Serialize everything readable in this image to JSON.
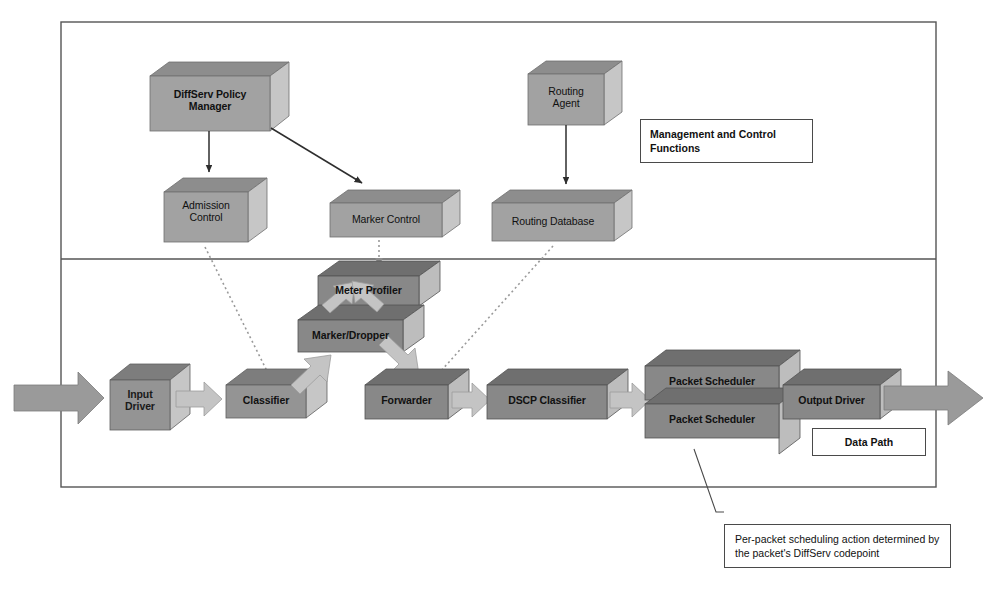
{
  "diagram": {
    "frame": {
      "outer_border_color": "#555555",
      "divider_label": "section-divider"
    },
    "palette": {
      "box_front_light": "#9e9e9e",
      "box_front_dark": "#7a7a7a",
      "box_top": "#8a8a8a",
      "box_side": "#c9c9c9",
      "arrow_flow": "#bdbdbd",
      "arrow_big": "#9a9a9a",
      "line": "#3a3a3a",
      "text": "#111111"
    },
    "sections": [
      {
        "id": "management",
        "label": "Management and\nControl Functions"
      },
      {
        "id": "datapath",
        "label": "Data Path"
      }
    ],
    "control_nodes": [
      {
        "id": "diffserv-policy-manager",
        "label": "DiffServ Policy\nManager"
      },
      {
        "id": "admission-control",
        "label": "Admission\nControl"
      },
      {
        "id": "marker-control",
        "label": "Marker Control"
      },
      {
        "id": "routing-agent",
        "label": "Routing\nAgent"
      },
      {
        "id": "routing-database",
        "label": "Routing Database"
      }
    ],
    "datapath_nodes": [
      {
        "id": "input-driver",
        "label": "Input\nDriver"
      },
      {
        "id": "classifier",
        "label": "Classifier"
      },
      {
        "id": "meter-profiler",
        "label": "Meter Profiler"
      },
      {
        "id": "marker-dropper",
        "label": "Marker/Dropper"
      },
      {
        "id": "forwarder",
        "label": "Forwarder"
      },
      {
        "id": "dscp-classifier",
        "label": "DSCP Classifier"
      },
      {
        "id": "packet-scheduler-1",
        "label": "Packet Scheduler"
      },
      {
        "id": "packet-scheduler-2",
        "label": "Packet Scheduler"
      },
      {
        "id": "output-driver",
        "label": "Output Driver"
      }
    ],
    "connections": [
      {
        "from": "diffserv-policy-manager",
        "to": "admission-control",
        "style": "solid"
      },
      {
        "from": "diffserv-policy-manager",
        "to": "marker-control",
        "style": "solid"
      },
      {
        "from": "routing-agent",
        "to": "routing-database",
        "style": "solid"
      },
      {
        "from": "admission-control",
        "to": "classifier",
        "style": "dotted"
      },
      {
        "from": "marker-control",
        "to": "meter-profiler",
        "style": "dotted"
      },
      {
        "from": "routing-database",
        "to": "forwarder",
        "style": "dotted"
      },
      {
        "from": "input-driver",
        "to": "classifier",
        "style": "flow-arrow"
      },
      {
        "from": "classifier",
        "to": "marker-dropper",
        "style": "flow-arrow"
      },
      {
        "from": "marker-dropper",
        "to": "meter-profiler",
        "style": "flow-arrow"
      },
      {
        "from": "meter-profiler",
        "to": "marker-dropper",
        "style": "flow-arrow"
      },
      {
        "from": "marker-dropper",
        "to": "forwarder",
        "style": "flow-arrow"
      },
      {
        "from": "forwarder",
        "to": "dscp-classifier",
        "style": "flow-arrow"
      },
      {
        "from": "dscp-classifier",
        "to": "packet-scheduler-1",
        "style": "flow-arrow"
      },
      {
        "from": "packet-scheduler-2",
        "to": "output-driver",
        "style": "flow-arrow"
      }
    ],
    "callout": {
      "id": "scheduling-callout",
      "text": "Per-packet scheduling action\ndetermined by the packet's\nDiffServ codepoint",
      "points_to": "packet-scheduler-2"
    }
  }
}
